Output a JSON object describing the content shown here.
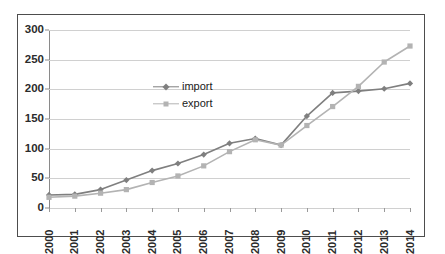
{
  "chart_data": {
    "type": "line",
    "title": "",
    "subtitle": "",
    "xlabel": "",
    "ylabel": "",
    "categories": [
      "2000",
      "2001",
      "2002",
      "2003",
      "2004",
      "2005",
      "2006",
      "2007",
      "2008",
      "2009",
      "2010",
      "2011",
      "2012",
      "2013",
      "2014"
    ],
    "series": [
      {
        "name": "import",
        "color": "#7f7f7f",
        "marker": "diamond",
        "values": [
          22,
          23,
          31,
          47,
          63,
          75,
          90,
          109,
          117,
          106,
          155,
          194,
          197,
          201,
          210
        ]
      },
      {
        "name": "export",
        "color": "#b3b3b3",
        "marker": "square",
        "values": [
          18,
          20,
          25,
          31,
          43,
          54,
          71,
          95,
          115,
          106,
          139,
          171,
          205,
          246,
          273
        ]
      }
    ],
    "ylim": [
      0,
      300
    ],
    "yticks": [
      0,
      50,
      100,
      150,
      200,
      250,
      300
    ],
    "ytick_labels": [
      "0",
      "50",
      "100",
      "150",
      "200",
      "250",
      "300"
    ],
    "grid": true,
    "grid_axis": "y",
    "legend_position": "inside-upper-left",
    "x_tick_rotation": 90,
    "colors": {
      "gridline": "#d0d0d0",
      "axis": "#8a8a8a",
      "frame_border": "#4d4d4d",
      "background": "#ffffff",
      "tick_text": "#2b2b2b"
    }
  },
  "legend": {
    "entries": [
      {
        "label": "import"
      },
      {
        "label": "export"
      }
    ]
  }
}
